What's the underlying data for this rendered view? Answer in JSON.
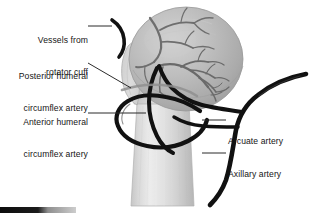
{
  "figure": {
    "domain": "anatomical-illustration",
    "background_color": "#ffffff",
    "palette": {
      "artery_dark": "#111111",
      "vessel_mid_gray": "#6e6e6e",
      "humeral_head_gray": "#b4b4b4",
      "humeral_shaft_gray": "#d7d7d7",
      "shaft_highlight": "#efefef",
      "outline_gray": "#9a9a9a",
      "leader_line": "#2b2b2b",
      "text_color": "#151515"
    }
  },
  "labels": {
    "vessels_rotator_cuff": {
      "line1": "Vessels from",
      "line2": "rotator cuff",
      "align": "right"
    },
    "posterior_humeral_circumflex": {
      "line1": "Posterior humeral",
      "line2": "circumflex artery",
      "align": "right"
    },
    "anterior_humeral_circumflex": {
      "line1": "Anterior humeral",
      "line2": "circumflex artery",
      "align": "right"
    },
    "arcuate_artery": {
      "line1": "Arcuate artery",
      "align": "left"
    },
    "axillary_artery": {
      "line1": "Axillary artery",
      "align": "left"
    }
  },
  "anatomy": {
    "humeral_head": "humeral-head",
    "humeral_shaft": "humeral-shaft",
    "greater_tuberosity": "greater-tuberosity",
    "anatomical_neck": "anatomical-neck"
  },
  "vessels": {
    "axillary_artery": "axillary-artery",
    "arcuate_artery": "arcuate-artery",
    "anterior_humeral_circumflex_artery": "anterior-humeral-circumflex-artery",
    "posterior_humeral_circumflex_artery": "posterior-humeral-circumflex-artery",
    "rotator_cuff_vessels": "rotator-cuff-vessels"
  },
  "corner_bar": {
    "name": "scale-bar"
  }
}
